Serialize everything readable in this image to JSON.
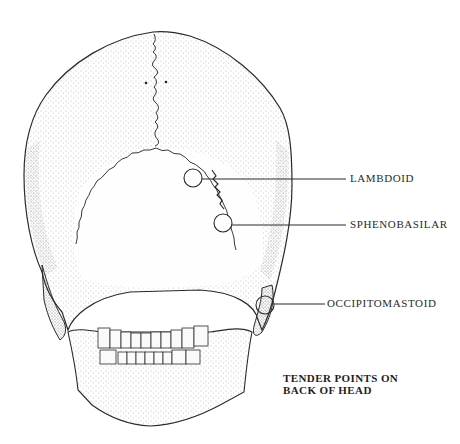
{
  "figure": {
    "caption_line1": "TENDER POINTS ON",
    "caption_line2": "BACK OF HEAD"
  },
  "tender_points": [
    {
      "label": "LAMBDOID",
      "cx": 193,
      "cy": 178,
      "r": 9,
      "line_y": 179,
      "line_end_x": 346,
      "label_x": 350,
      "label_y": 172
    },
    {
      "label": "SPHENOBASILAR",
      "cx": 223,
      "cy": 223,
      "r": 9,
      "line_y": 225,
      "line_end_x": 346,
      "label_x": 350,
      "label_y": 218
    },
    {
      "label": "OCCIPITOMASTOID",
      "cx": 265,
      "cy": 305,
      "r": 9,
      "line_y": 304,
      "line_end_x": 325,
      "label_x": 327,
      "label_y": 297
    }
  ],
  "colors": {
    "ink": "#2a2a2a",
    "stipple": "#8a8a8a",
    "background": "#ffffff"
  }
}
